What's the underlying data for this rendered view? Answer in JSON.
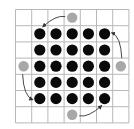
{
  "diagram": {
    "type": "grid-board",
    "rows": 7,
    "cols": 7,
    "grid_color": "#b8b8b8",
    "black_piece_color": "#0a0a0a",
    "gray_piece_color": "#a8a8a8",
    "arrow_color": "#333333",
    "black_pieces": [
      [
        1,
        1
      ],
      [
        1,
        2
      ],
      [
        1,
        3
      ],
      [
        1,
        4
      ],
      [
        1,
        5
      ],
      [
        2,
        1
      ],
      [
        2,
        2
      ],
      [
        2,
        3
      ],
      [
        2,
        4
      ],
      [
        2,
        5
      ],
      [
        3,
        1
      ],
      [
        3,
        2
      ],
      [
        3,
        3
      ],
      [
        3,
        4
      ],
      [
        3,
        5
      ],
      [
        4,
        1
      ],
      [
        4,
        2
      ],
      [
        4,
        3
      ],
      [
        4,
        4
      ],
      [
        4,
        5
      ],
      [
        5,
        1
      ],
      [
        5,
        2
      ],
      [
        5,
        3
      ],
      [
        5,
        4
      ],
      [
        5,
        5
      ]
    ],
    "gray_pieces": [
      [
        0,
        3
      ],
      [
        3,
        0
      ],
      [
        3,
        6
      ],
      [
        6,
        3
      ]
    ],
    "arrows": [
      {
        "from": "top-gray",
        "to": [
          1,
          1
        ],
        "direction": "counterclockwise"
      },
      {
        "from": "left-gray",
        "to": [
          5,
          1
        ],
        "direction": "counterclockwise"
      },
      {
        "from": "bottom-gray",
        "to": [
          5,
          5
        ],
        "direction": "counterclockwise"
      },
      {
        "from": "right-gray",
        "to": [
          1,
          5
        ],
        "direction": "counterclockwise"
      }
    ]
  }
}
